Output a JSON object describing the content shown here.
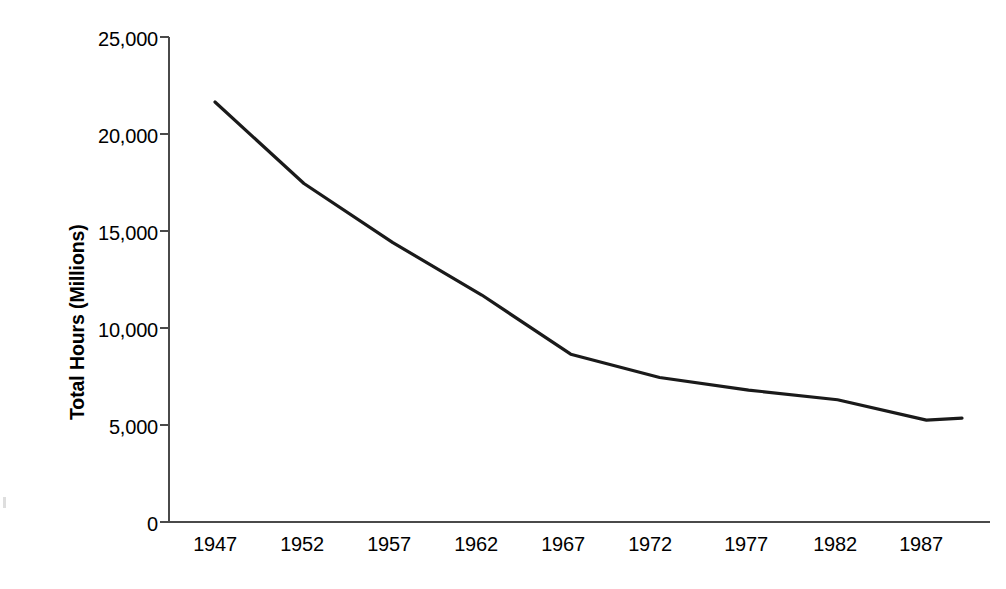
{
  "chart_data": {
    "type": "line",
    "title": "",
    "xlabel": "",
    "ylabel": "Total Hours (Millions)",
    "x": [
      1947,
      1952,
      1957,
      1962,
      1967,
      1972,
      1977,
      1982,
      1987,
      1989
    ],
    "values": [
      21650,
      17450,
      14400,
      11700,
      8650,
      7450,
      6800,
      6300,
      5250,
      5350
    ],
    "series": [
      {
        "name": "Total Hours",
        "values": [
          21650,
          17450,
          14400,
          11700,
          8650,
          7450,
          6800,
          6300,
          5250,
          5350
        ]
      }
    ],
    "xlim": [
      1947,
      1989
    ],
    "ylim": [
      0,
      25000
    ],
    "ytick_values": [
      0,
      5000,
      10000,
      15000,
      20000,
      25000
    ],
    "ytick_labels": [
      "0",
      "5,000",
      "10,000",
      "15,000",
      "20,000",
      "25,000"
    ],
    "xtick_values": [
      1947,
      1952,
      1957,
      1962,
      1967,
      1972,
      1977,
      1982,
      1987
    ],
    "xtick_labels": [
      "1947",
      "1952",
      "1957",
      "1962",
      "1967",
      "1972",
      "1977",
      "1982",
      "1987"
    ],
    "grid": false,
    "legend": false,
    "legend_position": "none",
    "line_color": "#1a1a1a",
    "line_width": 3.2,
    "axis_color": "#4a4a4a",
    "background_color": "#ffffff"
  },
  "axes": {
    "y_title": "Total Hours (Millions)",
    "y_labels": {
      "t0": "0",
      "t1": "5,000",
      "t2": "10,000",
      "t3": "15,000",
      "t4": "20,000",
      "t5": "25,000"
    },
    "x_labels": {
      "t0": "1947",
      "t1": "1952",
      "t2": "1957",
      "t3": "1962",
      "t4": "1967",
      "t5": "1972",
      "t6": "1977",
      "t7": "1982",
      "t8": "1987"
    }
  }
}
